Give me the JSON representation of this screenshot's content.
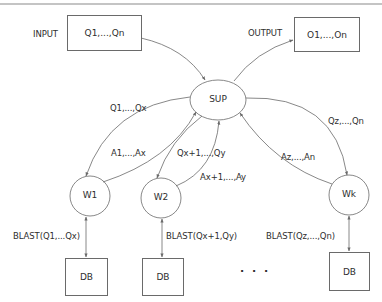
{
  "diagram": {
    "input": {
      "label": "INPUT",
      "content": "Q1,...,Qn"
    },
    "output": {
      "label": "OUTPUT",
      "content": "O1,...,On"
    },
    "supervisor": {
      "label": "SUP"
    },
    "workers": [
      {
        "label": "W1",
        "query_edge": "Q1,...,Qx",
        "answer_edge": "A1,...,Ax",
        "blast": "BLAST(Q1,...Qx)",
        "db": "DB"
      },
      {
        "label": "W2",
        "query_edge": "Qx+1,...,Qy",
        "answer_edge": "Ax+1,...,Ay",
        "blast": "BLAST(Qx+1,Qy)",
        "db": "DB"
      },
      {
        "label": "Wk",
        "query_edge": "Qz,...,Qn",
        "answer_edge": "Az,...,An",
        "blast": "BLAST(Qz,...,Qn)",
        "db": "DB"
      }
    ],
    "ellipsis": ". . .",
    "colors": {
      "stroke": "#6a6a6a",
      "text": "#2e2e2e",
      "background": "#ffffff"
    }
  }
}
